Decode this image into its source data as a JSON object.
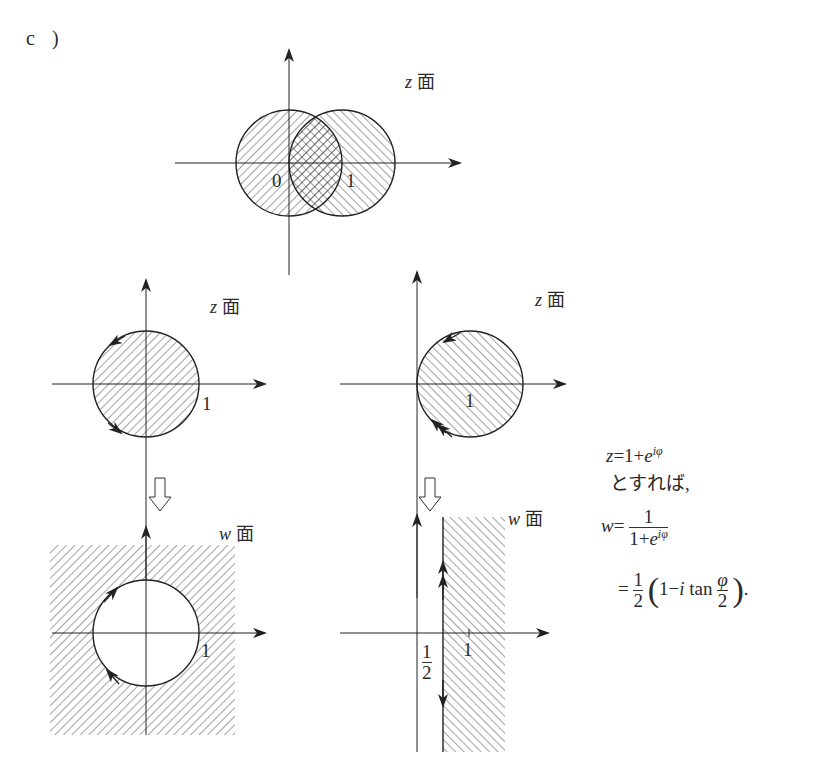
{
  "part_label": "c )",
  "plane_label_char": "面",
  "diagrams": {
    "top": {
      "plane_var": "z",
      "label_zero": "0",
      "label_one": "1",
      "description": "Two overlapping unit-radius circles centered at 0 and 1; left hatched /, right hatched \\, overlap cross-hatched"
    },
    "middle_left": {
      "plane_var": "z",
      "label_one": "1",
      "description": "Disk |z|<=1 hatched, boundary oriented counterclockwise"
    },
    "middle_right": {
      "plane_var": "z",
      "label_one": "1",
      "description": "Disk |z-1|<=1 hatched, boundary oriented counterclockwise, double arrow"
    },
    "bottom_left": {
      "plane_var": "w",
      "label_one": "1",
      "description": "Exterior of unit circle hatched, boundary oriented clockwise"
    },
    "bottom_right": {
      "plane_var": "w",
      "label_half_num": "1",
      "label_half_den": "2",
      "label_one": "1",
      "description": "Half-plane Re w >= 1/2 hatched"
    }
  },
  "formula": {
    "line1_lhs": "z",
    "line1_eq": "=1+",
    "line1_e": "e",
    "line1_exp": "iφ",
    "line2": "とすれば,",
    "line3_lhs": "w",
    "line3_eq": "=",
    "line3_num": "1",
    "line3_den_a": "1+",
    "line3_den_e": "e",
    "line3_den_exp": "iφ",
    "line4_eq": "=",
    "line4_half_num": "1",
    "line4_half_den": "2",
    "line4_lparen": "(",
    "line4_body_a": "1−",
    "line4_i": "i",
    "line4_tan": " tan ",
    "line4_phi_num": "φ",
    "line4_phi_den": "2",
    "line4_rparen": ")",
    "line4_end": "."
  },
  "colors": {
    "ink": "#2a2a2a",
    "background": "#ffffff"
  }
}
